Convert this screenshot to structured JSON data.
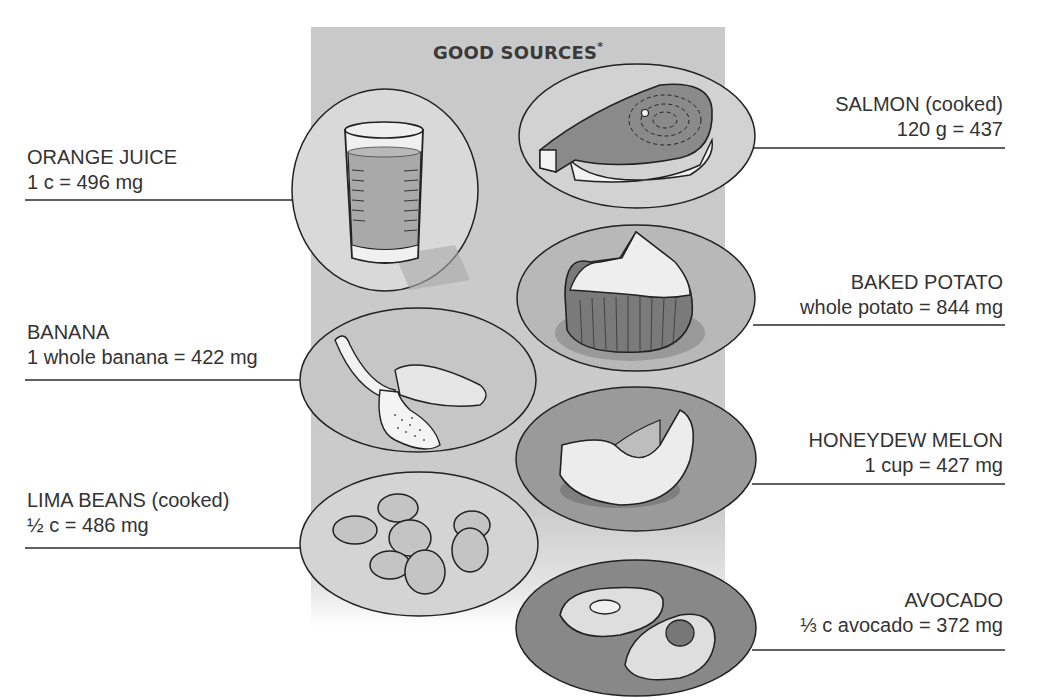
{
  "panel": {
    "title": "GOOD SOURCES",
    "title_mark": "*",
    "background": "#c9c9c9"
  },
  "foods": {
    "orange_juice": {
      "name": "ORANGE JUICE",
      "amount": "1 c = 496 mg",
      "side": "left",
      "icon": "glass-of-juice-icon"
    },
    "banana": {
      "name": "BANANA",
      "amount": "1 whole banana = 422 mg",
      "side": "left",
      "icon": "peeled-banana-icon"
    },
    "lima_beans": {
      "name": "LIMA BEANS (cooked)",
      "amount": "½ c = 486 mg",
      "side": "left",
      "icon": "lima-beans-icon"
    },
    "salmon": {
      "name": "SALMON (cooked)",
      "amount": "120 g = 437",
      "side": "right",
      "icon": "salmon-steak-icon"
    },
    "baked_potato": {
      "name": "BAKED POTATO",
      "amount": "whole potato = 844 mg",
      "side": "right",
      "icon": "baked-potato-icon"
    },
    "honeydew": {
      "name": "HONEYDEW MELON",
      "amount": "1 cup = 427 mg",
      "side": "right",
      "icon": "melon-slice-icon"
    },
    "avocado": {
      "name": "AVOCADO",
      "amount": "⅓ c avocado = 372 mg",
      "side": "right",
      "icon": "avocado-halves-icon"
    }
  },
  "colors": {
    "line": "#2a2a2a",
    "plate_light": "#d6d6d6",
    "plate_mid": "#b9b9b9",
    "plate_dark": "#8f8f8f",
    "food_light": "#e8e8e8",
    "food_dark": "#7a7a7a"
  }
}
